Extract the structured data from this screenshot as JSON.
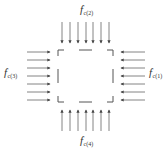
{
  "diagram": {
    "title": "",
    "labels": {
      "top": {
        "base": "f",
        "prime": "′",
        "subscript": "c(2)"
      },
      "left": {
        "base": "f",
        "prime": "′",
        "subscript": "c(3)"
      },
      "right": {
        "base": "f",
        "prime": "′",
        "subscript": "c(1)"
      },
      "bottom": {
        "base": "f",
        "prime": "′",
        "subscript": "c(4)"
      }
    },
    "arrows_per_side": 7,
    "colors": {
      "line": "#555555",
      "arrow": "#555555",
      "text": "#333333"
    }
  }
}
